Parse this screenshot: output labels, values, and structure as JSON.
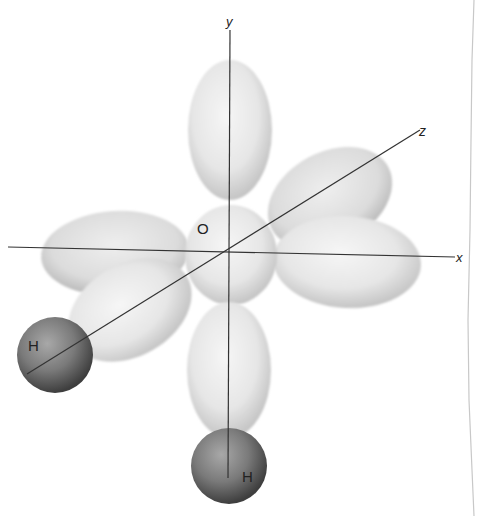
{
  "figure": {
    "axes": {
      "x_label": "x",
      "y_label": "y",
      "z_label": "z"
    },
    "atoms": {
      "oxygen_label": "O",
      "hydrogen_left_label": "H",
      "hydrogen_bottom_label": "H"
    },
    "colors": {
      "background": "#ffffff",
      "lobe_fill": "#ececec",
      "lobe_shade": "#b8b8b8",
      "hydrogen_light": "#9a9a9a",
      "hydrogen_dark": "#4a4a4a",
      "axis_line": "#333333",
      "page_edge": "#c8c8c8"
    }
  }
}
